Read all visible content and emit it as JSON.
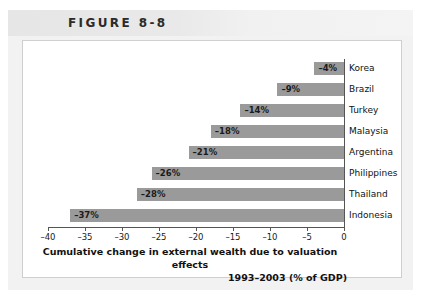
{
  "figure": {
    "header_label": "FIGURE 8-8"
  },
  "chart_data": {
    "type": "bar",
    "orientation": "horizontal",
    "title": "",
    "categories": [
      "Korea",
      "Brazil",
      "Turkey",
      "Malaysia",
      "Argentina",
      "Philippines",
      "Thailand",
      "Indonesia"
    ],
    "values": [
      -4,
      -9,
      -14,
      -18,
      -21,
      -26,
      -28,
      -37
    ],
    "data_labels": [
      "–4%",
      "–9%",
      "–14%",
      "–18%",
      "–21%",
      "–26%",
      "–28%",
      "–37%"
    ],
    "xlabel": "Cumulative change in external wealth due to valuation effects 1993–2003 (% of GDP)",
    "xlabel_line1": "Cumulative change in external wealth due to valuation effects",
    "xlabel_line2": "1993–2003 (% of GDP)",
    "ylabel": "",
    "xlim": [
      -40,
      0
    ],
    "xticks": [
      -40,
      -35,
      -30,
      -25,
      -20,
      -15,
      -10,
      -5,
      0
    ],
    "xtick_labels": [
      "–40",
      "–35",
      "–30",
      "–25",
      "–20",
      "–15",
      "–10",
      "–5",
      "0"
    ],
    "grid": false,
    "legend": false,
    "bar_color": "#9a9a9a",
    "axis_color": "#555555",
    "label_color": "#111111"
  }
}
